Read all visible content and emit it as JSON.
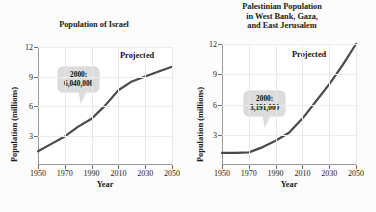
{
  "figure": {
    "background": "#fcfcfc",
    "line_color": "#4a4a4a",
    "callout_bg": "#dcdcdc"
  },
  "charts": [
    {
      "title": "Population of Israel",
      "projected_label": "Projected",
      "callout": {
        "line1": "2000:",
        "line2": "6,040,000"
      },
      "axis_title_x": "Year",
      "axis_title_y": "Population (millions)",
      "xticks": [
        "1950",
        "1970",
        "1990",
        "2010",
        "2030",
        "2050"
      ],
      "yticks": [
        "3",
        "6",
        "9",
        "12"
      ]
    },
    {
      "title_line1": "Palestinian Population",
      "title_line2": "in West Bank, Gaza,",
      "title_line3": "and East Jerusalem",
      "projected_label": "Projected",
      "callout": {
        "line1": "2000:",
        "line2": "3,191,000"
      },
      "axis_title_x": "Year",
      "axis_title_y": "Population (millions)",
      "xticks": [
        "1950",
        "1970",
        "1990",
        "2010",
        "2030",
        "2050"
      ],
      "yticks": [
        "3",
        "6",
        "9",
        "12"
      ]
    }
  ],
  "chart_data": [
    {
      "type": "line",
      "title": "Population of Israel",
      "xlabel": "Year",
      "ylabel": "Population (millions)",
      "xlim": [
        1950,
        2050
      ],
      "ylim": [
        0,
        12
      ],
      "xticks": [
        1950,
        1970,
        1990,
        2010,
        2030,
        2050
      ],
      "yticks": [
        3,
        6,
        9,
        12
      ],
      "grid": true,
      "legend": "none",
      "annotations": [
        {
          "text": "2000: 6,040,000",
          "x": 2000,
          "y": 6.04
        },
        {
          "text": "Projected",
          "x": 2028,
          "y": 10.9
        }
      ],
      "series": [
        {
          "name": "Israel population",
          "x": [
            1950,
            1960,
            1970,
            1980,
            1990,
            2000,
            2010,
            2020,
            2030,
            2040,
            2050
          ],
          "values": [
            1.4,
            2.15,
            2.9,
            3.9,
            4.7,
            6.04,
            7.6,
            8.5,
            9.0,
            9.5,
            10.0
          ]
        }
      ]
    },
    {
      "type": "line",
      "title": "Palestinian Population in West Bank, Gaza, and East Jerusalem",
      "xlabel": "Year",
      "ylabel": "Population (millions)",
      "xlim": [
        1950,
        2050
      ],
      "ylim": [
        0,
        12
      ],
      "xticks": [
        1950,
        1970,
        1990,
        2010,
        2030,
        2050
      ],
      "yticks": [
        3,
        6,
        9,
        12
      ],
      "grid": true,
      "legend": "none",
      "annotations": [
        {
          "text": "2000: 3,191,000",
          "x": 2000,
          "y": 3.191
        },
        {
          "text": "Projected",
          "x": 2026,
          "y": 11.0
        }
      ],
      "series": [
        {
          "name": "Palestinian population",
          "x": [
            1950,
            1960,
            1970,
            1980,
            1990,
            2000,
            2010,
            2020,
            2030,
            2040,
            2050
          ],
          "values": [
            1.2,
            1.2,
            1.25,
            1.75,
            2.4,
            3.191,
            4.6,
            6.3,
            8.0,
            9.9,
            12.0
          ]
        }
      ]
    }
  ]
}
